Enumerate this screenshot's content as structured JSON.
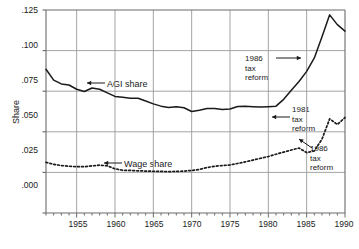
{
  "chart_data": {
    "type": "line",
    "title": "",
    "xlabel": "",
    "ylabel": "Share",
    "xlim": [
      1951,
      1990
    ],
    "ylim": [
      0.0,
      0.125
    ],
    "grid": true,
    "legend_position": "inline-annotations",
    "ytick_labels": [
      ".125",
      ".100",
      ".075",
      ".050",
      ".025",
      ".000"
    ],
    "ytick_values": [
      0.125,
      0.1,
      0.075,
      0.05,
      0.025,
      0.0
    ],
    "xtick_labels": [
      "1955",
      "1960",
      "1965",
      "1970",
      "1975",
      "1980",
      "1985",
      "1990"
    ],
    "xtick_values": [
      1955,
      1960,
      1965,
      1970,
      1975,
      1980,
      1985,
      1990
    ],
    "x": [
      1951,
      1952,
      1953,
      1954,
      1955,
      1956,
      1957,
      1958,
      1959,
      1960,
      1961,
      1962,
      1963,
      1964,
      1965,
      1966,
      1967,
      1968,
      1969,
      1970,
      1971,
      1972,
      1973,
      1974,
      1975,
      1976,
      1977,
      1978,
      1979,
      1980,
      1981,
      1982,
      1983,
      1984,
      1985,
      1986,
      1987,
      1988,
      1989,
      1990
    ],
    "series": [
      {
        "name": "AGI share",
        "style": "solid",
        "color": "#1a1a1a",
        "values": [
          0.0885,
          0.0818,
          0.0795,
          0.0788,
          0.0762,
          0.0748,
          0.077,
          0.0762,
          0.074,
          0.0718,
          0.0713,
          0.0707,
          0.0707,
          0.069,
          0.0672,
          0.0658,
          0.065,
          0.0654,
          0.0648,
          0.0625,
          0.0633,
          0.0644,
          0.0643,
          0.0637,
          0.064,
          0.0656,
          0.0657,
          0.0655,
          0.0653,
          0.0655,
          0.0658,
          0.07,
          0.0756,
          0.081,
          0.0872,
          0.0955,
          0.1085,
          0.122,
          0.116,
          0.112
        ]
      },
      {
        "name": "Wage share",
        "style": "dotted",
        "color": "#1a1a1a",
        "values": [
          0.0312,
          0.03,
          0.0292,
          0.0288,
          0.0285,
          0.0285,
          0.029,
          0.0295,
          0.029,
          0.0272,
          0.0263,
          0.0262,
          0.026,
          0.0258,
          0.0257,
          0.0256,
          0.0255,
          0.0256,
          0.0258,
          0.0262,
          0.0268,
          0.028,
          0.0288,
          0.0292,
          0.0296,
          0.0305,
          0.0315,
          0.0326,
          0.0337,
          0.0348,
          0.0362,
          0.0375,
          0.0388,
          0.04,
          0.0372,
          0.0382,
          0.0455,
          0.058,
          0.0545,
          0.0588
        ]
      }
    ],
    "annotations": [
      {
        "id": "agi-1986-tax-reform",
        "text_lines": [
          "1986",
          "tax",
          "reform"
        ],
        "arrow_direction": "right",
        "target_series": "AGI share",
        "target_year": 1986
      },
      {
        "id": "agi-1981-tax-reform",
        "text_lines": [
          "1981",
          "tax",
          "reform"
        ],
        "arrow_direction": "left",
        "target_series": "AGI share",
        "target_year": 1981
      },
      {
        "id": "wage-1986-tax-reform",
        "text_lines": [
          "1986",
          "tax",
          "reform"
        ],
        "arrow_direction": "up-left",
        "target_series": "Wage share",
        "target_year": 1986
      },
      {
        "id": "agi-share-label",
        "text_lines": [
          "AGI share"
        ],
        "arrow_direction": "left",
        "target_series": "AGI share",
        "target_year": 1958
      },
      {
        "id": "wage-share-label",
        "text_lines": [
          "Wage share"
        ],
        "arrow_direction": "left",
        "target_series": "Wage share",
        "target_year": 1959
      }
    ]
  },
  "labels": {
    "y_axis_title": "Share",
    "ytick_0": ".125",
    "ytick_1": ".100",
    "ytick_2": ".075",
    "ytick_3": ".050",
    "ytick_4": ".025",
    "ytick_5": ".000",
    "xtick_0": "1955",
    "xtick_1": "1960",
    "xtick_2": "1965",
    "xtick_3": "1970",
    "xtick_4": "1975",
    "xtick_5": "1980",
    "xtick_6": "1985",
    "xtick_7": "1990",
    "agi_share": "AGI share",
    "wage_share": "Wage share",
    "annot_1986_a_l1": "1986",
    "annot_1986_a_l2": "tax",
    "annot_1986_a_l3": "reform",
    "annot_1981_l1": "1981",
    "annot_1981_l2": "tax",
    "annot_1981_l3": "reform",
    "annot_1986_b_l1": "1986",
    "annot_1986_b_l2": "tax",
    "annot_1986_b_l3": "reform"
  },
  "colors": {
    "line": "#1a1a1a",
    "grid": "#9a9a9a",
    "axis": "#6b6b6b",
    "background": "#ffffff"
  }
}
